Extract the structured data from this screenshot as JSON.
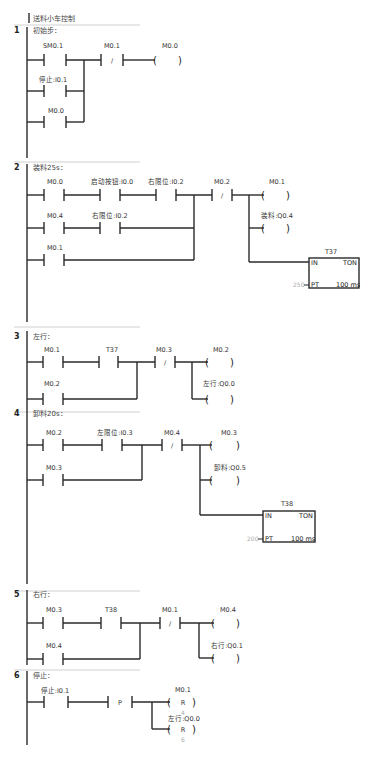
{
  "program_title": "送料小车控制",
  "networks": [
    {
      "number": "1",
      "title": "初始步：",
      "contacts": [
        {
          "label": "SM0.1",
          "type": "NO"
        },
        {
          "label": "停止:I0.1",
          "type": "NO"
        },
        {
          "label": "M0.0",
          "type": "NO"
        },
        {
          "label": "M0.1",
          "type": "NC"
        }
      ],
      "coils": [
        {
          "label": "M0.0",
          "type": "output"
        }
      ]
    },
    {
      "number": "2",
      "title": "装料25s：",
      "contacts": [
        {
          "label": "M0.0",
          "type": "NO"
        },
        {
          "label": "启动按钮:I0.0",
          "type": "NO"
        },
        {
          "label": "右限位:I0.2",
          "type": "NO"
        },
        {
          "label": "M0.4",
          "type": "NO"
        },
        {
          "label": "右限位:I0.2",
          "type": "NO"
        },
        {
          "label": "M0.1",
          "type": "NO"
        },
        {
          "label": "M0.2",
          "type": "NC"
        }
      ],
      "coils": [
        {
          "label": "M0.1",
          "type": "output"
        },
        {
          "label": "装料:Q0.4",
          "type": "output"
        }
      ],
      "timer": {
        "name": "T37",
        "type": "TON",
        "in": "IN",
        "pt_label": "PT",
        "pt_value": "250",
        "base": "100 ms"
      }
    },
    {
      "number": "3",
      "title": "左行：",
      "contacts": [
        {
          "label": "M0.1",
          "type": "NO"
        },
        {
          "label": "T37",
          "type": "NO"
        },
        {
          "label": "M0.2",
          "type": "NO"
        },
        {
          "label": "M0.3",
          "type": "NC"
        }
      ],
      "coils": [
        {
          "label": "M0.2",
          "type": "output"
        },
        {
          "label": "左行:Q0.0",
          "type": "output"
        }
      ]
    },
    {
      "number": "4",
      "title": "卸料20s：",
      "contacts": [
        {
          "label": "M0.2",
          "type": "NO"
        },
        {
          "label": "左限位:I0.3",
          "type": "NO"
        },
        {
          "label": "M0.3",
          "type": "NO"
        },
        {
          "label": "M0.4",
          "type": "NC"
        }
      ],
      "coils": [
        {
          "label": "M0.3",
          "type": "output"
        },
        {
          "label": "卸料:Q0.5",
          "type": "output"
        }
      ],
      "timer": {
        "name": "T38",
        "type": "TON",
        "in": "IN",
        "pt_label": "PT",
        "pt_value": "200",
        "base": "100 ms"
      }
    },
    {
      "number": "5",
      "title": "右行：",
      "contacts": [
        {
          "label": "M0.3",
          "type": "NO"
        },
        {
          "label": "T38",
          "type": "NO"
        },
        {
          "label": "M0.4",
          "type": "NO"
        },
        {
          "label": "M0.1",
          "type": "NC"
        }
      ],
      "coils": [
        {
          "label": "M0.4",
          "type": "output"
        },
        {
          "label": "右行:Q0.1",
          "type": "output"
        }
      ]
    },
    {
      "number": "6",
      "title": "停止：",
      "contacts": [
        {
          "label": "停止:I0.1",
          "type": "NO"
        },
        {
          "label": "P",
          "type": "positive-edge"
        }
      ],
      "coils": [
        {
          "label": "M0.1",
          "type": "reset",
          "symbol": "R",
          "count": "4"
        },
        {
          "label": "左行:Q0.0",
          "type": "reset",
          "symbol": "R",
          "count": "6"
        }
      ]
    }
  ],
  "symbols": {
    "nc": "/",
    "reset": "R",
    "open": "(",
    "close": ")"
  }
}
